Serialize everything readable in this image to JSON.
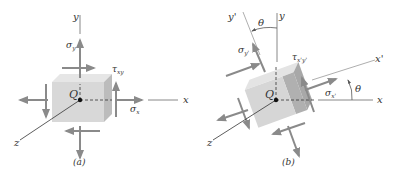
{
  "figure_a": {
    "caption": "(a)",
    "origin_label": "Q",
    "axis_x": "x",
    "axis_y": "y",
    "axis_z": "z",
    "sigma_y": {
      "main": "σ",
      "sub": "y"
    },
    "sigma_x": {
      "main": "σ",
      "sub": "x"
    },
    "tau_xy": {
      "main": "τ",
      "sub": "xy"
    }
  },
  "figure_b": {
    "caption": "(b)",
    "origin_label": "Q",
    "axis_x": "x",
    "axis_y": "y",
    "axis_z": "z",
    "axis_x_prime": "x'",
    "axis_y_prime": "y'",
    "theta_top": "θ",
    "theta_right": "θ",
    "sigma_y_prime": {
      "main": "σ",
      "sub": "y'"
    },
    "sigma_x_prime": {
      "main": "σ",
      "sub": "x'"
    },
    "tau_xy_prime": {
      "main": "τ",
      "sub": "x'y'"
    }
  },
  "colors": {
    "cube_front": "#d6d6d6",
    "cube_top": "#e4e4e4",
    "cube_side": "#b8b8b8",
    "arrow": "#8a8a8a",
    "axis": "#888888",
    "text": "#333333"
  }
}
